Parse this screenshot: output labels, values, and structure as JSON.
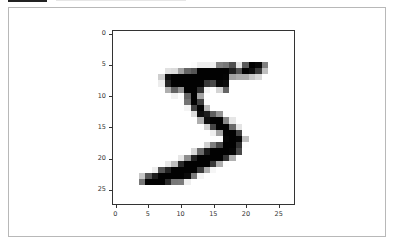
{
  "chart_data": {
    "type": "heatmap",
    "title": "",
    "xlabel": "",
    "ylabel": "",
    "colormap": "gray_r",
    "xlim": [
      -0.5,
      27.5
    ],
    "ylim": [
      27.5,
      -0.5
    ],
    "grid": false,
    "x_ticks": [
      0,
      5,
      10,
      15,
      20,
      25
    ],
    "y_ticks": [
      0,
      5,
      10,
      15,
      20,
      25
    ],
    "x_tick_labels": [
      "0",
      "5",
      "10",
      "15",
      "20",
      "25"
    ],
    "y_tick_labels": [
      "0",
      "5",
      "10",
      "15",
      "20",
      "25"
    ],
    "values": [
      [
        0,
        0,
        0,
        0,
        0,
        0,
        0,
        0,
        0,
        0,
        0,
        0,
        0,
        0,
        0,
        0,
        0,
        0,
        0,
        0,
        0,
        0,
        0,
        0,
        0,
        0,
        0,
        0
      ],
      [
        0,
        0,
        0,
        0,
        0,
        0,
        0,
        0,
        0,
        0,
        0,
        0,
        0,
        0,
        0,
        0,
        0,
        0,
        0,
        0,
        0,
        0,
        0,
        0,
        0,
        0,
        0,
        0
      ],
      [
        0,
        0,
        0,
        0,
        0,
        0,
        0,
        0,
        0,
        0,
        0,
        0,
        0,
        0,
        0,
        0,
        0,
        0,
        0,
        0,
        0,
        0,
        0,
        0,
        0,
        0,
        0,
        0
      ],
      [
        0,
        0,
        0,
        0,
        0,
        0,
        0,
        0,
        0,
        0,
        0,
        0,
        0,
        0,
        0,
        0,
        0,
        0,
        0,
        0,
        0,
        0,
        0,
        0,
        0,
        0,
        0,
        0
      ],
      [
        0,
        0,
        0,
        0,
        0,
        0,
        0,
        0,
        0,
        0,
        0,
        0,
        0,
        0,
        0,
        0,
        0,
        0,
        0,
        0,
        0,
        0,
        0,
        0,
        0,
        0,
        0,
        0
      ],
      [
        0,
        0,
        0,
        0,
        0,
        0,
        0,
        0,
        0,
        0,
        0,
        0,
        3,
        18,
        18,
        18,
        126,
        136,
        175,
        26,
        166,
        255,
        247,
        127,
        0,
        0,
        0,
        0
      ],
      [
        0,
        0,
        0,
        0,
        0,
        0,
        0,
        0,
        30,
        36,
        94,
        154,
        170,
        253,
        253,
        253,
        253,
        253,
        225,
        172,
        253,
        242,
        195,
        64,
        0,
        0,
        0,
        0
      ],
      [
        0,
        0,
        0,
        0,
        0,
        0,
        0,
        49,
        238,
        253,
        253,
        253,
        253,
        253,
        253,
        253,
        253,
        251,
        93,
        82,
        82,
        56,
        39,
        0,
        0,
        0,
        0,
        0
      ],
      [
        0,
        0,
        0,
        0,
        0,
        0,
        0,
        18,
        219,
        253,
        253,
        253,
        253,
        253,
        198,
        182,
        247,
        241,
        0,
        0,
        0,
        0,
        0,
        0,
        0,
        0,
        0,
        0
      ],
      [
        0,
        0,
        0,
        0,
        0,
        0,
        0,
        0,
        80,
        156,
        107,
        253,
        253,
        205,
        11,
        0,
        43,
        154,
        0,
        0,
        0,
        0,
        0,
        0,
        0,
        0,
        0,
        0
      ],
      [
        0,
        0,
        0,
        0,
        0,
        0,
        0,
        0,
        0,
        14,
        1,
        154,
        253,
        90,
        0,
        0,
        0,
        0,
        0,
        0,
        0,
        0,
        0,
        0,
        0,
        0,
        0,
        0
      ],
      [
        0,
        0,
        0,
        0,
        0,
        0,
        0,
        0,
        0,
        0,
        0,
        139,
        253,
        190,
        2,
        0,
        0,
        0,
        0,
        0,
        0,
        0,
        0,
        0,
        0,
        0,
        0,
        0
      ],
      [
        0,
        0,
        0,
        0,
        0,
        0,
        0,
        0,
        0,
        0,
        0,
        11,
        190,
        253,
        70,
        0,
        0,
        0,
        0,
        0,
        0,
        0,
        0,
        0,
        0,
        0,
        0,
        0
      ],
      [
        0,
        0,
        0,
        0,
        0,
        0,
        0,
        0,
        0,
        0,
        0,
        0,
        35,
        241,
        225,
        160,
        108,
        1,
        0,
        0,
        0,
        0,
        0,
        0,
        0,
        0,
        0,
        0
      ],
      [
        0,
        0,
        0,
        0,
        0,
        0,
        0,
        0,
        0,
        0,
        0,
        0,
        0,
        81,
        240,
        253,
        253,
        119,
        25,
        0,
        0,
        0,
        0,
        0,
        0,
        0,
        0,
        0
      ],
      [
        0,
        0,
        0,
        0,
        0,
        0,
        0,
        0,
        0,
        0,
        0,
        0,
        0,
        0,
        45,
        186,
        253,
        253,
        150,
        27,
        0,
        0,
        0,
        0,
        0,
        0,
        0,
        0
      ],
      [
        0,
        0,
        0,
        0,
        0,
        0,
        0,
        0,
        0,
        0,
        0,
        0,
        0,
        0,
        0,
        16,
        93,
        252,
        253,
        187,
        0,
        0,
        0,
        0,
        0,
        0,
        0,
        0
      ],
      [
        0,
        0,
        0,
        0,
        0,
        0,
        0,
        0,
        0,
        0,
        0,
        0,
        0,
        0,
        0,
        0,
        0,
        249,
        253,
        249,
        64,
        0,
        0,
        0,
        0,
        0,
        0,
        0
      ],
      [
        0,
        0,
        0,
        0,
        0,
        0,
        0,
        0,
        0,
        0,
        0,
        0,
        0,
        0,
        46,
        130,
        183,
        253,
        253,
        207,
        2,
        0,
        0,
        0,
        0,
        0,
        0,
        0
      ],
      [
        0,
        0,
        0,
        0,
        0,
        0,
        0,
        0,
        0,
        0,
        0,
        0,
        39,
        148,
        229,
        253,
        253,
        253,
        250,
        182,
        0,
        0,
        0,
        0,
        0,
        0,
        0,
        0
      ],
      [
        0,
        0,
        0,
        0,
        0,
        0,
        0,
        0,
        0,
        0,
        24,
        114,
        221,
        253,
        253,
        253,
        253,
        201,
        78,
        0,
        0,
        0,
        0,
        0,
        0,
        0,
        0,
        0
      ],
      [
        0,
        0,
        0,
        0,
        0,
        0,
        0,
        0,
        23,
        66,
        213,
        253,
        253,
        253,
        253,
        198,
        81,
        2,
        0,
        0,
        0,
        0,
        0,
        0,
        0,
        0,
        0,
        0
      ],
      [
        0,
        0,
        0,
        0,
        0,
        0,
        18,
        171,
        219,
        253,
        253,
        253,
        253,
        195,
        80,
        9,
        0,
        0,
        0,
        0,
        0,
        0,
        0,
        0,
        0,
        0,
        0,
        0
      ],
      [
        0,
        0,
        0,
        0,
        55,
        172,
        226,
        253,
        253,
        253,
        253,
        244,
        133,
        11,
        0,
        0,
        0,
        0,
        0,
        0,
        0,
        0,
        0,
        0,
        0,
        0,
        0,
        0
      ],
      [
        0,
        0,
        0,
        0,
        136,
        253,
        253,
        253,
        212,
        135,
        132,
        16,
        0,
        0,
        0,
        0,
        0,
        0,
        0,
        0,
        0,
        0,
        0,
        0,
        0,
        0,
        0,
        0
      ],
      [
        0,
        0,
        0,
        0,
        0,
        0,
        0,
        0,
        0,
        0,
        0,
        0,
        0,
        0,
        0,
        0,
        0,
        0,
        0,
        0,
        0,
        0,
        0,
        0,
        0,
        0,
        0,
        0
      ],
      [
        0,
        0,
        0,
        0,
        0,
        0,
        0,
        0,
        0,
        0,
        0,
        0,
        0,
        0,
        0,
        0,
        0,
        0,
        0,
        0,
        0,
        0,
        0,
        0,
        0,
        0,
        0,
        0
      ],
      [
        0,
        0,
        0,
        0,
        0,
        0,
        0,
        0,
        0,
        0,
        0,
        0,
        0,
        0,
        0,
        0,
        0,
        0,
        0,
        0,
        0,
        0,
        0,
        0,
        0,
        0,
        0,
        0
      ]
    ]
  },
  "axes": {
    "y_ticks": [
      {
        "label": "0",
        "pos": 0
      },
      {
        "label": "5",
        "pos": 5
      },
      {
        "label": "10",
        "pos": 10
      },
      {
        "label": "15",
        "pos": 15
      },
      {
        "label": "20",
        "pos": 20
      },
      {
        "label": "25",
        "pos": 25
      }
    ],
    "x_ticks": [
      {
        "label": "0",
        "pos": 0
      },
      {
        "label": "5",
        "pos": 5
      },
      {
        "label": "10",
        "pos": 10
      },
      {
        "label": "15",
        "pos": 15
      },
      {
        "label": "20",
        "pos": 20
      },
      {
        "label": "25",
        "pos": 25
      }
    ]
  }
}
